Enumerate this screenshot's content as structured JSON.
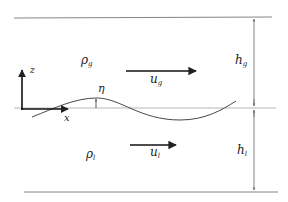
{
  "diagram": {
    "type": "two-layer stratified flow schematic",
    "colors": {
      "line": "#555555",
      "thick": "#222222",
      "text": "#222222"
    },
    "labels": {
      "rho_g": {
        "base": "ρ",
        "sub": "g"
      },
      "rho_l": {
        "base": "ρ",
        "sub": "l"
      },
      "u_g": {
        "base": "u",
        "sub": "g"
      },
      "u_l": {
        "base": "u",
        "sub": "l"
      },
      "h_g": {
        "base": "h",
        "sub": "g"
      },
      "h_l": {
        "base": "h",
        "sub": "l"
      },
      "eta": "η",
      "z_axis": "z",
      "x_axis": "x"
    }
  }
}
